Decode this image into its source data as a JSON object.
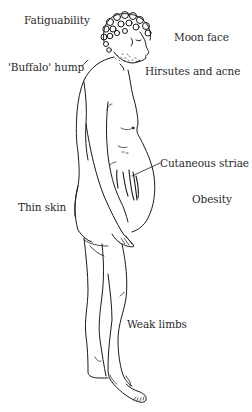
{
  "diagram": {
    "labels": [
      {
        "id": "fatiguability",
        "text": "Fatiguability",
        "x": 24,
        "y": 14
      },
      {
        "id": "moon-face",
        "text": "Moon face",
        "x": 174,
        "y": 31
      },
      {
        "id": "buffalo-hump",
        "text": "'Buffalo' hump",
        "x": 8,
        "y": 61
      },
      {
        "id": "hirsutes-acne",
        "text": "Hirsutes and acne",
        "x": 145,
        "y": 65
      },
      {
        "id": "cutaneous-striae",
        "text": "Cutaneous striae",
        "x": 160,
        "y": 157
      },
      {
        "id": "obesity",
        "text": "Obesity",
        "x": 192,
        "y": 193
      },
      {
        "id": "thin-skin",
        "text": "Thin skin",
        "x": 18,
        "y": 201
      },
      {
        "id": "weak-limbs",
        "text": "Weak limbs",
        "x": 127,
        "y": 318
      }
    ],
    "colors": {
      "line": "#1a1a1a",
      "text": "#2a2a2a",
      "background": "#ffffff"
    }
  }
}
